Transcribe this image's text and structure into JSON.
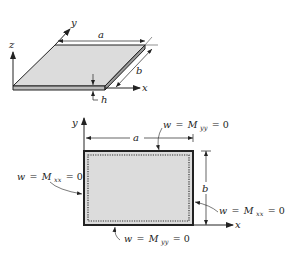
{
  "figure": {
    "colors": {
      "plate_fill": "#dcdcdc",
      "line": "#222222",
      "background": "#ffffff"
    },
    "top_view_3d": {
      "axes": {
        "x": "x",
        "y": "y",
        "z": "z"
      },
      "dimensions": {
        "length": "a",
        "width": "b",
        "thickness": "h"
      }
    },
    "plan_view": {
      "axes": {
        "x": "x",
        "y": "y"
      },
      "dimensions": {
        "length": "a",
        "width": "b"
      },
      "boundary_conditions": {
        "top": {
          "w": "w",
          "eq1": "=",
          "M": "M",
          "sub": "yy",
          "eq2": "= 0"
        },
        "bottom": {
          "w": "w",
          "eq1": "=",
          "M": "M",
          "sub": "yy",
          "eq2": "= 0"
        },
        "left": {
          "w": "w",
          "eq1": "=",
          "M": "M",
          "sub": "xx",
          "eq2": "= 0"
        },
        "right": {
          "w": "w",
          "eq1": "=",
          "M": "M",
          "sub": "xx",
          "eq2": "= 0"
        }
      }
    }
  }
}
